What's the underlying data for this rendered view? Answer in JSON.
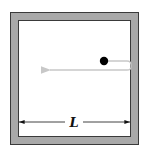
{
  "diagram": {
    "title": "",
    "dimension_label": "L",
    "colors": {
      "wall_fill": "#a9a9a9",
      "wall_stroke": "#3a3a3a",
      "interior": "#ffffff",
      "particle": "#000000",
      "path": "#c8c8c8",
      "dimension_line": "#111111"
    },
    "elements": [
      {
        "id": "box",
        "type": "square-enclosure",
        "description": "Box with gray walls"
      },
      {
        "id": "particle",
        "type": "ball",
        "description": "Black particle inside box"
      },
      {
        "id": "trajectory",
        "type": "arrow-path",
        "description": "Particle path bouncing off right wall and heading left"
      },
      {
        "id": "dimension",
        "type": "dimension-line",
        "label": "L",
        "description": "Inner width of box"
      }
    ]
  }
}
